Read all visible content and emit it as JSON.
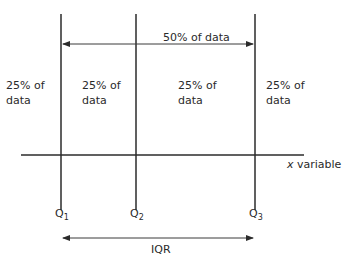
{
  "diagram": {
    "regions": [
      {
        "line1": "25% of",
        "line2": "data"
      },
      {
        "line1": "25% of",
        "line2": "data"
      },
      {
        "line1": "25% of",
        "line2": "data"
      },
      {
        "line1": "25% of",
        "line2": "data"
      }
    ],
    "top_arrow_label": "50% of data",
    "axis_label_var": "x",
    "axis_label_rest": " variable",
    "quartiles": [
      {
        "letter": "Q",
        "sub": "1"
      },
      {
        "letter": "Q",
        "sub": "2"
      },
      {
        "letter": "Q",
        "sub": "3"
      }
    ],
    "bottom_arrow_label": "IQR",
    "line_color": "#2b2b2b"
  }
}
